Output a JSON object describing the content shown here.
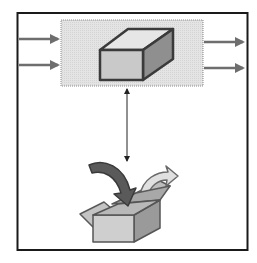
{
  "diagram": {
    "title": "",
    "nodes": [
      {
        "id": "component",
        "icon": "cube-icon",
        "shape": "shaded-rectangle-with-3d-box"
      },
      {
        "id": "package",
        "icon": "open-box-with-arrows-icon"
      }
    ],
    "inputs": [
      {
        "id": "input-1"
      },
      {
        "id": "input-2"
      }
    ],
    "outputs": [
      {
        "id": "output-1"
      },
      {
        "id": "output-2"
      }
    ],
    "links": [
      {
        "from": "component",
        "to": "package",
        "style": "double-headed-arrow"
      }
    ],
    "colors": {
      "frame": "#1a1a1a",
      "panel_fill": "#e2e2e2",
      "panel_stroke": "#8a8a8a",
      "arrow": "#6e6e6e",
      "cube_front": "#c9c9c9",
      "cube_top": "#e6e6e6",
      "cube_side": "#8f8f8f",
      "cube_stroke": "#3a3a3a",
      "box_front": "#cfcfcf",
      "box_side": "#9a9a9a",
      "box_flap": "#bdbdbd",
      "curved_arrow_dark": "#5a5a5a",
      "curved_arrow_light": "#d8d8d8"
    }
  }
}
